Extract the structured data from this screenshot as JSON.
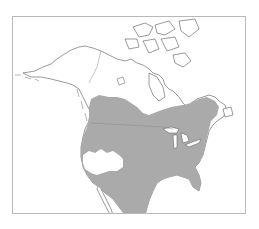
{
  "map": {
    "title": "",
    "region": "North America",
    "subject": "species distribution range",
    "colors": {
      "range_fill": "#aaaaaa",
      "land_fill": "#ffffff",
      "coastline": "#555555",
      "frame_border": "#b9b9b9",
      "background": "#ffffff"
    },
    "features": [
      {
        "name": "Alaska",
        "shaded": false
      },
      {
        "name": "Canadian Arctic Archipelago",
        "shaded": false
      },
      {
        "name": "Northern Canada",
        "shaded": false
      },
      {
        "name": "Southern Canadian Prairies",
        "shaded": true
      },
      {
        "name": "Southern Ontario and Quebec",
        "shaded": true
      },
      {
        "name": "Contiguous United States",
        "shaded": true
      },
      {
        "name": "California and Great Basin",
        "shaded": false
      },
      {
        "name": "Northern Mexico",
        "shaded": true
      },
      {
        "name": "Baja California",
        "shaded": false
      }
    ]
  }
}
